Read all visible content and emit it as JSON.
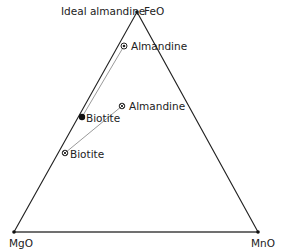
{
  "diagram": {
    "type": "ternary",
    "vertices": {
      "top": {
        "label": "FeO",
        "annotation": "Ideal almandine"
      },
      "bottom_left": {
        "label": "MgO"
      },
      "bottom_right": {
        "label": "MnO"
      }
    },
    "points": [
      {
        "label": "Almandine",
        "marker": "circle-dot"
      },
      {
        "label": "Almandine",
        "marker": "circle-x"
      },
      {
        "label": "Biotite",
        "marker": "filled-circle"
      },
      {
        "label": "Biotite",
        "marker": "circle-x"
      }
    ],
    "tie_lines": [
      {
        "from": "Almandine (upper)",
        "to": "Biotite (filled)"
      },
      {
        "from": "Almandine (lower)",
        "to": "Biotite (lower)"
      }
    ],
    "colors": {
      "axes": "#222222",
      "tie_lines": "#9a9a9a"
    }
  }
}
